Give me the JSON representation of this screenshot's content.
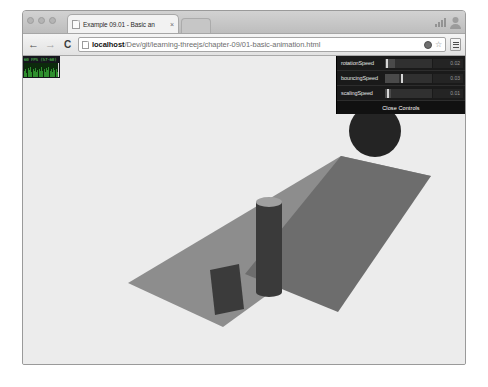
{
  "browser": {
    "window_controls": [
      "minimize",
      "maximize",
      "close"
    ],
    "tab": {
      "title": "Example 09.01 - Basic an",
      "close_label": "×",
      "favicon": "page-icon"
    },
    "nav": {
      "back_label": "←",
      "forward_label": "→",
      "reload_label": "C",
      "url_host": "localhost",
      "url_path": "/Dev/git/learning-threejs/chapter-09/01-basic-animation.html",
      "url_full": "localhost/Dev/git/learning-threejs/chapter-09/01-basic-animation.html",
      "placeholder": "Search Google or type URL",
      "star_label": "☆",
      "badge_label": "page-action-badge",
      "menu_label": "☰"
    }
  },
  "stats": {
    "label": "60 FPS (57-60)",
    "fps_current": 60,
    "fps_min": 57,
    "fps_max": 60,
    "graph_bars": [
      40,
      55,
      30,
      62,
      48,
      70,
      35,
      58,
      44,
      66,
      38,
      52,
      60,
      46,
      72,
      41,
      56,
      33,
      64,
      50,
      68,
      42,
      57,
      36,
      61,
      47,
      54,
      39,
      100
    ]
  },
  "datgui": {
    "controls": [
      {
        "name": "rotationSpeed",
        "value": "0.02",
        "fill_pct": 22,
        "knob_pct": 3
      },
      {
        "name": "bouncingSpeed",
        "value": "0.03",
        "fill_pct": 30,
        "knob_pct": 33
      },
      {
        "name": "scalingSpeed",
        "value": "0.01",
        "fill_pct": 12,
        "knob_pct": 5
      }
    ],
    "close_label": "Close Controls"
  },
  "scene": {
    "background_color": "#ececec",
    "plane": {
      "name": "ground-plane",
      "color_light": "#8e8e8e",
      "color_dark": "#6b6b6b",
      "points_light": "127,237 340,110 430,130 222,281",
      "points_dark": "244,228 340,110 430,130 337,266"
    },
    "objects": [
      {
        "name": "cube",
        "color": "#3c3c3c"
      },
      {
        "name": "cylinder",
        "color": "#3a3a3a",
        "cap_color": "#9e9e9e"
      },
      {
        "name": "sphere",
        "color": "#232323"
      }
    ]
  }
}
